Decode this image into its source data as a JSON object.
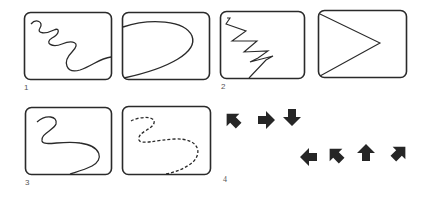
{
  "figure": {
    "panels": [
      {
        "id": "1",
        "label": "1",
        "frames": [
          {
            "name": "wavy-line-frame",
            "shape": "meandering wavy line from top-left to bottom-right"
          },
          {
            "name": "parabola-frame",
            "shape": "open curve (D-shape) from top-left bending right and back to bottom-left"
          }
        ]
      },
      {
        "id": "2",
        "label": "2",
        "frames": [
          {
            "name": "zigzag-frame",
            "shape": "zigzag line descending from top-left to bottom"
          },
          {
            "name": "triangle-frame",
            "shape": "two straight lines meeting at a point on the right (V rotated)"
          }
        ]
      },
      {
        "id": "3",
        "label": "3",
        "frames": [
          {
            "name": "s-curve-solid-frame",
            "shape": "smooth S-shaped solid curve"
          },
          {
            "name": "s-curve-dashed-frame",
            "shape": "smooth S-shaped dashed curve"
          }
        ]
      },
      {
        "id": "4",
        "label": "4",
        "arrows": [
          {
            "direction": "northwest",
            "row": 1
          },
          {
            "direction": "east",
            "row": 1
          },
          {
            "direction": "south",
            "row": 1
          },
          {
            "direction": "west",
            "row": 2
          },
          {
            "direction": "northwest",
            "row": 2
          },
          {
            "direction": "north",
            "row": 2
          },
          {
            "direction": "northeast",
            "row": 2
          }
        ]
      }
    ],
    "colors": {
      "stroke": "#2a2a2a",
      "fill": "#262626",
      "background": "#ffffff"
    }
  }
}
